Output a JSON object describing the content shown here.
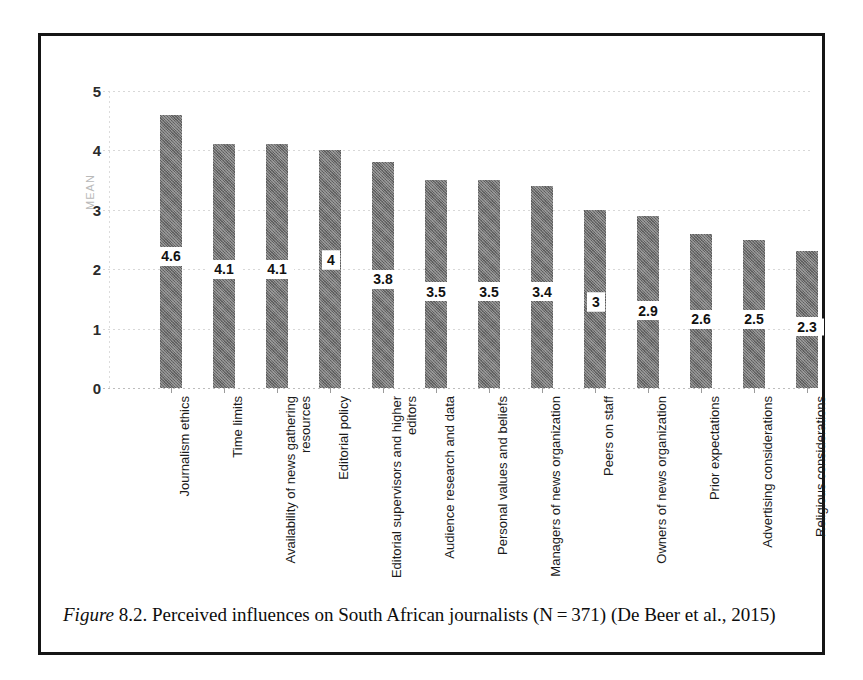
{
  "figure": {
    "caption_prefix": "Figure",
    "caption_number": "8.2.",
    "caption_text": "Perceived influences on South African journalists (N = 371) (De Beer et al., 2015)"
  },
  "chart_data": {
    "type": "bar",
    "title": "",
    "xlabel": "",
    "ylabel": "MEAN",
    "ylim": [
      0,
      5
    ],
    "ytick_labels": [
      "5",
      "4",
      "3",
      "2",
      "1",
      "0"
    ],
    "yticks": [
      5,
      4,
      3,
      2,
      1,
      0
    ],
    "grid": true,
    "legend": "none",
    "orientation": "vertical",
    "bar_color": "#6f6f6f",
    "categories": [
      "Journalism ethics",
      "Time limits",
      "Availability of news gathering\nresources",
      "Editorial policy",
      "Editorial supervisors and higher\neditors",
      "Audience research and data",
      "Personal values and beliefs",
      "Managers of news organization",
      "Peers on staff",
      "Owners of news organization",
      "Prior expectations",
      "Advertising considerations",
      "Religious considerations"
    ],
    "values": [
      4.6,
      4.1,
      4.1,
      4,
      3.8,
      3.5,
      3.5,
      3.4,
      3,
      2.9,
      2.6,
      2.5,
      2.3
    ],
    "value_labels": [
      "4.6",
      "4.1",
      "4.1",
      "4",
      "3.8",
      "3.5",
      "3.5",
      "3.4",
      "3",
      "2.9",
      "2.6",
      "2.5",
      "2.3"
    ],
    "label_positions": [
      2.22,
      2.0,
      2.0,
      2.15,
      1.83,
      1.62,
      1.62,
      1.62,
      1.45,
      1.3,
      1.16,
      1.16,
      1.03
    ],
    "label_boxed": [
      false,
      false,
      false,
      true,
      false,
      false,
      false,
      false,
      true,
      false,
      false,
      false,
      false
    ]
  }
}
